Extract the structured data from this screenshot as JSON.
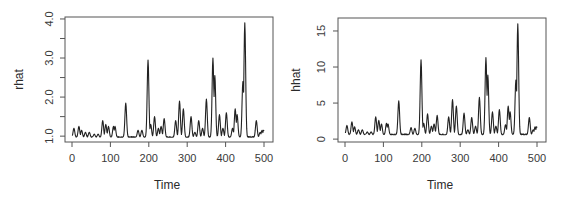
{
  "chart_data": [
    {
      "type": "line",
      "title": "",
      "xlabel": "Time",
      "ylabel": "rhat",
      "xlim": [
        0,
        500
      ],
      "ylim": [
        0.85,
        4.05
      ],
      "xticks": [
        0,
        100,
        200,
        300,
        400,
        500
      ],
      "xtick_labels": [
        "0",
        "100",
        "200",
        "300",
        "400",
        "500"
      ],
      "yticks": [
        1.0,
        1.5,
        2.0,
        2.5,
        3.0,
        3.5,
        4.0
      ],
      "ytick_labels": [
        "1.0",
        "",
        "2.0",
        "",
        "3.0",
        "",
        "4.0"
      ],
      "grid": false,
      "baseline": 0.97,
      "series": [
        {
          "name": "rhat",
          "peaks": [
            [
              5,
              1.2
            ],
            [
              18,
              1.25
            ],
            [
              25,
              1.15
            ],
            [
              35,
              1.1
            ],
            [
              45,
              1.1
            ],
            [
              58,
              1.05
            ],
            [
              68,
              1.05
            ],
            [
              80,
              1.4
            ],
            [
              88,
              1.3
            ],
            [
              95,
              1.25
            ],
            [
              108,
              1.25
            ],
            [
              112,
              1.25
            ],
            [
              140,
              1.85
            ],
            [
              172,
              1.15
            ],
            [
              182,
              1.15
            ],
            [
              198,
              2.95
            ],
            [
              205,
              1.3
            ],
            [
              215,
              1.5
            ],
            [
              225,
              1.2
            ],
            [
              232,
              1.25
            ],
            [
              240,
              1.45
            ],
            [
              270,
              1.4
            ],
            [
              280,
              1.9
            ],
            [
              290,
              1.7
            ],
            [
              310,
              1.5
            ],
            [
              320,
              1.1
            ],
            [
              330,
              1.4
            ],
            [
              340,
              1.2
            ],
            [
              350,
              1.95
            ],
            [
              367,
              3.0
            ],
            [
              372,
              2.55
            ],
            [
              384,
              1.55
            ],
            [
              393,
              1.2
            ],
            [
              402,
              1.6
            ],
            [
              418,
              1.2
            ],
            [
              425,
              1.7
            ],
            [
              430,
              1.55
            ],
            [
              445,
              2.4
            ],
            [
              450,
              3.9
            ],
            [
              480,
              1.4
            ],
            [
              490,
              1.1
            ],
            [
              495,
              1.15
            ],
            [
              499,
              1.15
            ]
          ]
        }
      ]
    },
    {
      "type": "line",
      "title": "",
      "xlabel": "Time",
      "ylabel": "hhat",
      "xlim": [
        0,
        500
      ],
      "ylim": [
        -0.4,
        16.8
      ],
      "xticks": [
        0,
        100,
        200,
        300,
        400,
        500
      ],
      "xtick_labels": [
        "0",
        "100",
        "200",
        "300",
        "400",
        "500"
      ],
      "yticks": [
        0,
        5,
        10,
        15
      ],
      "ytick_labels": [
        "0",
        "5",
        "10",
        "15"
      ],
      "grid": false,
      "baseline": 0.6,
      "series": [
        {
          "name": "hhat",
          "peaks": [
            [
              5,
              1.9
            ],
            [
              18,
              2.4
            ],
            [
              25,
              1.7
            ],
            [
              35,
              1.3
            ],
            [
              45,
              1.3
            ],
            [
              58,
              1.0
            ],
            [
              68,
              1.0
            ],
            [
              80,
              3.1
            ],
            [
              88,
              2.6
            ],
            [
              95,
              2.1
            ],
            [
              108,
              2.2
            ],
            [
              112,
              2.1
            ],
            [
              140,
              5.3
            ],
            [
              172,
              1.6
            ],
            [
              182,
              1.5
            ],
            [
              198,
              11.0
            ],
            [
              205,
              2.2
            ],
            [
              215,
              3.5
            ],
            [
              225,
              1.8
            ],
            [
              232,
              2.1
            ],
            [
              240,
              3.3
            ],
            [
              270,
              3.1
            ],
            [
              280,
              5.5
            ],
            [
              290,
              4.6
            ],
            [
              310,
              3.6
            ],
            [
              320,
              1.3
            ],
            [
              330,
              3.0
            ],
            [
              340,
              1.8
            ],
            [
              350,
              5.8
            ],
            [
              367,
              11.3
            ],
            [
              372,
              8.9
            ],
            [
              384,
              3.8
            ],
            [
              393,
              1.8
            ],
            [
              402,
              4.1
            ],
            [
              418,
              2.0
            ],
            [
              425,
              4.6
            ],
            [
              430,
              3.8
            ],
            [
              445,
              8.2
            ],
            [
              450,
              16.0
            ],
            [
              480,
              3.0
            ],
            [
              490,
              1.3
            ],
            [
              495,
              1.7
            ],
            [
              499,
              1.7
            ]
          ]
        }
      ]
    }
  ]
}
